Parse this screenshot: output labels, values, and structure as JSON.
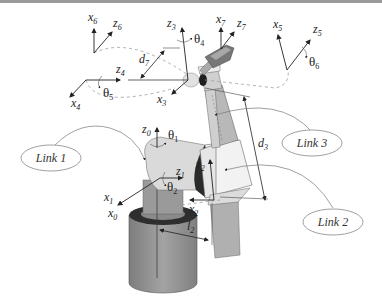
{
  "diagram": {
    "type": "robot-manipulator-kinematics",
    "frames": {
      "x0": {
        "base": "x",
        "sub": "0"
      },
      "z0": {
        "base": "z",
        "sub": "0"
      },
      "x1": {
        "base": "x",
        "sub": "1"
      },
      "z1": {
        "base": "z",
        "sub": "1"
      },
      "x2": {
        "base": "x",
        "sub": "2"
      },
      "z2": {
        "base": "z",
        "sub": "2"
      },
      "x3": {
        "base": "x",
        "sub": "3"
      },
      "z3": {
        "base": "z",
        "sub": "3"
      },
      "x4": {
        "base": "x",
        "sub": "4"
      },
      "z4": {
        "base": "z",
        "sub": "4"
      },
      "x5": {
        "base": "x",
        "sub": "5"
      },
      "z5": {
        "base": "z",
        "sub": "5"
      },
      "x6": {
        "base": "x",
        "sub": "6"
      },
      "z6": {
        "base": "z",
        "sub": "6"
      },
      "x7": {
        "base": "x",
        "sub": "7"
      },
      "z7": {
        "base": "z",
        "sub": "7"
      }
    },
    "joint_angles": {
      "theta1": {
        "base": "θ",
        "sub": "1"
      },
      "theta2": {
        "base": "θ",
        "sub": "2"
      },
      "theta4": {
        "base": "θ",
        "sub": "4"
      },
      "theta5": {
        "base": "θ",
        "sub": "5"
      },
      "theta6": {
        "base": "θ",
        "sub": "6"
      }
    },
    "dimensions": {
      "d3": {
        "base": "d",
        "sub": "3"
      },
      "d7": {
        "base": "d",
        "sub": "7"
      },
      "l2": {
        "base": "l",
        "sub": "2"
      }
    },
    "links": {
      "link1": "Link 1",
      "link2": "Link 2",
      "link3": "Link 3"
    },
    "colors": {
      "border": "#9a9a9a",
      "base_cylinder": "#8f8f8f",
      "base_ring": "#2e2e2e",
      "shoulder": "#d9d9d9",
      "link_light": "#ececec",
      "link_mid": "#b5b5b5",
      "axis_line": "#333333",
      "dashed": "#9a9a9a"
    }
  }
}
